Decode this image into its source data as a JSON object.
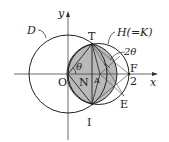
{
  "diagram": {
    "labels": {
      "y_axis": "y",
      "x_axis": "x",
      "origin": "O",
      "circle_d": "D",
      "circle_h": "H(=K)",
      "point_t": "T",
      "point_i": "I",
      "point_n": "N",
      "point_f": "F",
      "point_e": "E",
      "tick_2": "2",
      "angle_theta": "θ",
      "angle_2theta": "2θ",
      "point_a": "A"
    },
    "colors": {
      "stroke": "#222222",
      "shade": "#b9b9b9"
    }
  }
}
